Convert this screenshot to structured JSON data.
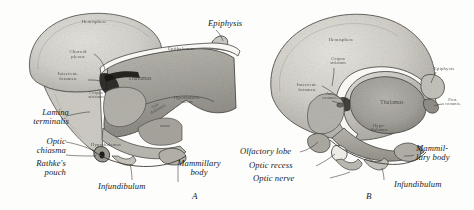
{
  "figure": {
    "type": "anatomical-illustration",
    "panels": [
      {
        "id": "A",
        "label": "A",
        "labels": [
          {
            "name": "hemisphere",
            "text": "Hemisphere",
            "style": "inner"
          },
          {
            "name": "choroid-plexus",
            "text": "Choroid\nplexus",
            "style": "inner"
          },
          {
            "name": "intervent-foramen",
            "text": "Intervent.\nforamen",
            "style": "inner"
          },
          {
            "name": "corpus-striatum",
            "text": "Corpus\nstriatum",
            "style": "inner"
          },
          {
            "name": "epithalamus",
            "text": "Epithalamus",
            "style": "inner"
          },
          {
            "name": "thalamus",
            "text": "Thalamus",
            "style": "inner"
          },
          {
            "name": "hypothalamic-sulcus",
            "text": "Hypothalamic\nsulcus",
            "style": "inner"
          },
          {
            "name": "sub-thalamus",
            "text": "Sub-\nthalamus",
            "style": "inner"
          },
          {
            "name": "hypothalamus",
            "text": "Hypothalamus",
            "style": "inner"
          },
          {
            "name": "epiphysis",
            "text": "Epiphysis",
            "style": "outer"
          },
          {
            "name": "lamina-terminalis",
            "text": "Lamina\nterminalis",
            "style": "outer"
          },
          {
            "name": "optic-chiasma",
            "text": "Optic\nchiasma",
            "style": "outer"
          },
          {
            "name": "rathkes-pouch",
            "text": "Rathke's\npouch",
            "style": "outer"
          },
          {
            "name": "infundibulum",
            "text": "Infundibulum",
            "style": "outer"
          },
          {
            "name": "mammillary-body",
            "text": "Mammillary\nbody",
            "style": "outer"
          }
        ]
      },
      {
        "id": "B",
        "label": "B",
        "labels": [
          {
            "name": "hemisphere",
            "text": "Hemisphere",
            "style": "inner"
          },
          {
            "name": "intervent-foramen",
            "text": "Intervent.\nforamen",
            "style": "inner"
          },
          {
            "name": "corpus-striatum",
            "text": "Corpus\nstriatum",
            "style": "inner"
          },
          {
            "name": "ant-commis",
            "text": "Ant.\ncommis.",
            "style": "inner"
          },
          {
            "name": "thalamus",
            "text": "Thalamus",
            "style": "inner"
          },
          {
            "name": "epiphysis",
            "text": "Epiphysis",
            "style": "inner"
          },
          {
            "name": "post-commis",
            "text": "Post.\ncommis.",
            "style": "inner"
          },
          {
            "name": "hypothalamus",
            "text": "Hypo-\nthalamus",
            "style": "inner"
          },
          {
            "name": "olfactory-lobe",
            "text": "Olfactory lobe",
            "style": "outer"
          },
          {
            "name": "optic-recess",
            "text": "Optic recess",
            "style": "outer"
          },
          {
            "name": "optic-nerve",
            "text": "Optic nerve",
            "style": "outer"
          },
          {
            "name": "mammillary-body",
            "text": "Mammil-\nlary body",
            "style": "outer"
          },
          {
            "name": "infundibulum",
            "text": "Infundibulum",
            "style": "outer"
          }
        ]
      }
    ],
    "colors": {
      "background": "#fdfdfc",
      "ink": "#1a1a1a",
      "tissue_light": "#d9d7d1",
      "tissue_mid": "#c2c0b9",
      "tissue_dark": "#a6a49d",
      "tissue_darker": "#8e8c85",
      "outline": "#4a4a46",
      "cavity": "#f7f6f2",
      "shadow": "#2a2a27"
    }
  }
}
